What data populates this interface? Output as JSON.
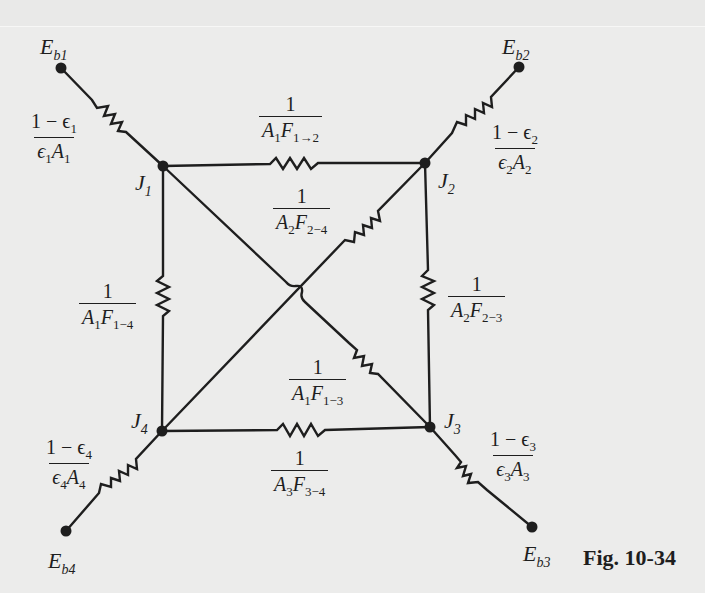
{
  "figure": {
    "caption": "Fig. 10-34",
    "background": "#ececeb",
    "ink": "#1e1e1e"
  },
  "nodes": {
    "Eb1": {
      "main": "E",
      "sub": "b1",
      "x": 61,
      "y": 68
    },
    "Eb2": {
      "main": "E",
      "sub": "b2",
      "x": 519,
      "y": 67
    },
    "Eb3": {
      "main": "E",
      "sub": "b3",
      "x": 532,
      "y": 527
    },
    "Eb4": {
      "main": "E",
      "sub": "b4",
      "x": 66,
      "y": 531
    },
    "J1": {
      "main": "J",
      "sub": "1",
      "x": 163,
      "y": 166
    },
    "J2": {
      "main": "J",
      "sub": "2",
      "x": 425,
      "y": 163
    },
    "J3": {
      "main": "J",
      "sub": "3",
      "x": 430,
      "y": 427
    },
    "J4": {
      "main": "J",
      "sub": "4",
      "x": 162,
      "y": 431
    }
  },
  "resistances": {
    "surface_1": {
      "num": "1 − ϵ",
      "num_sub": "1",
      "den_a": "ϵ",
      "den_a_sub": "1",
      "den_b": "A",
      "den_b_sub": "1",
      "between": "Eb1-J1"
    },
    "surface_2": {
      "num": "1 − ϵ",
      "num_sub": "2",
      "den_a": "ϵ",
      "den_a_sub": "2",
      "den_b": "A",
      "den_b_sub": "2",
      "between": "Eb2-J2"
    },
    "surface_3": {
      "num": "1 − ϵ",
      "num_sub": "3",
      "den_a": "ϵ",
      "den_a_sub": "3",
      "den_b": "A",
      "den_b_sub": "3",
      "between": "J3-Eb3"
    },
    "surface_4": {
      "num": "1 − ϵ",
      "num_sub": "4",
      "den_a": "ϵ",
      "den_a_sub": "4",
      "den_b": "A",
      "den_b_sub": "4",
      "between": "J4-Eb4"
    },
    "space_12": {
      "num": "1",
      "a": "A",
      "a_sub": "1",
      "f": "F",
      "f_sub": "1→2",
      "between": "J1-J2"
    },
    "space_24": {
      "num": "1",
      "a": "A",
      "a_sub": "2",
      "f": "F",
      "f_sub": "2−4",
      "between": "J2-J4"
    },
    "space_14": {
      "num": "1",
      "a": "A",
      "a_sub": "1",
      "f": "F",
      "f_sub": "1−4",
      "between": "J1-J4"
    },
    "space_23": {
      "num": "1",
      "a": "A",
      "a_sub": "2",
      "f": "F",
      "f_sub": "2−3",
      "between": "J2-J3"
    },
    "space_13": {
      "num": "1",
      "a": "A",
      "a_sub": "1",
      "f": "F",
      "f_sub": "1−3",
      "between": "J1-J3"
    },
    "space_34": {
      "num": "1",
      "a": "A",
      "a_sub": "3",
      "f": "F",
      "f_sub": "3−4",
      "between": "J3-J4"
    }
  }
}
